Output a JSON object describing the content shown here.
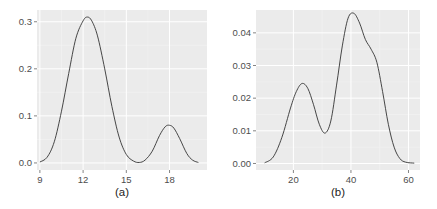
{
  "chart_data": [
    {
      "type": "line",
      "subtype": "density",
      "caption": "(a)",
      "title": "",
      "xlabel": "",
      "ylabel": "",
      "xlim": [
        8.8,
        20.6
      ],
      "ylim": [
        -0.015,
        0.325
      ],
      "xticks": [
        9,
        12,
        15,
        18
      ],
      "xtick_labels": [
        "9",
        "12",
        "15",
        "18"
      ],
      "yticks": [
        0.0,
        0.1,
        0.2,
        0.3
      ],
      "ytick_labels": [
        "0.0",
        "0.1",
        "0.2",
        "0.3"
      ],
      "grid": true,
      "legend": null,
      "x": [
        9.0,
        9.5,
        10.0,
        10.5,
        11.0,
        11.5,
        12.0,
        12.3,
        12.6,
        13.0,
        13.5,
        14.0,
        14.5,
        15.0,
        15.5,
        15.9,
        16.3,
        16.8,
        17.3,
        17.7,
        18.0,
        18.3,
        18.7,
        19.2,
        19.6,
        20.0
      ],
      "y": [
        0.002,
        0.012,
        0.045,
        0.11,
        0.19,
        0.265,
        0.302,
        0.31,
        0.302,
        0.27,
        0.2,
        0.12,
        0.055,
        0.018,
        0.004,
        0.001,
        0.006,
        0.025,
        0.058,
        0.077,
        0.08,
        0.074,
        0.052,
        0.02,
        0.006,
        0.001
      ]
    },
    {
      "type": "line",
      "subtype": "density",
      "caption": "(b)",
      "title": "",
      "xlabel": "",
      "ylabel": "",
      "xlim": [
        7,
        64
      ],
      "ylim": [
        -0.002,
        0.047
      ],
      "xticks": [
        20,
        40,
        60
      ],
      "xtick_labels": [
        "20",
        "40",
        "60"
      ],
      "yticks": [
        0.0,
        0.01,
        0.02,
        0.03,
        0.04
      ],
      "ytick_labels": [
        "0.00",
        "0.01",
        "0.02",
        "0.03",
        "0.04"
      ],
      "grid": true,
      "legend": null,
      "x": [
        10,
        13,
        16,
        19,
        21,
        23,
        25,
        27,
        29,
        31,
        33,
        35,
        37,
        39,
        41,
        43,
        45,
        47,
        49,
        51,
        53,
        55,
        57,
        59,
        62
      ],
      "y": [
        0.0002,
        0.002,
        0.008,
        0.017,
        0.022,
        0.0245,
        0.023,
        0.018,
        0.012,
        0.0093,
        0.013,
        0.024,
        0.036,
        0.0445,
        0.046,
        0.043,
        0.038,
        0.035,
        0.031,
        0.022,
        0.012,
        0.005,
        0.0015,
        0.0004,
        0.0001
      ]
    }
  ],
  "panels": {
    "a": {
      "caption": "(a)",
      "xtick_labels": [
        "9",
        "12",
        "15",
        "18"
      ],
      "ytick_labels": [
        "0.0",
        "0.1",
        "0.2",
        "0.3"
      ]
    },
    "b": {
      "caption": "(b)",
      "xtick_labels": [
        "20",
        "40",
        "60"
      ],
      "ytick_labels": [
        "0.00",
        "0.01",
        "0.02",
        "0.03",
        "0.04"
      ]
    }
  },
  "colors": {
    "panel_background": "#ebebeb",
    "grid_major": "#ffffff",
    "grid_minor": "#f5f5f5",
    "line": "#333333",
    "tick_text": "#4d4d4d"
  }
}
